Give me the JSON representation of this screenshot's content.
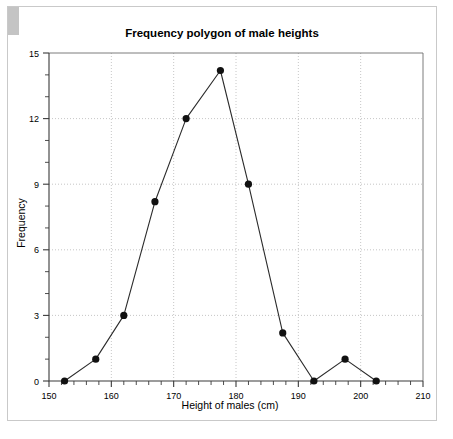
{
  "chart_data": {
    "type": "line",
    "title": "Frequency polygon of male heights",
    "xlabel": "Height of males (cm)",
    "ylabel": "Frequency",
    "xlim": [
      150,
      210
    ],
    "ylim": [
      0,
      15
    ],
    "grid": true,
    "legend": "none",
    "marker": "filled-circle",
    "x_ticks_major": [
      150,
      160,
      170,
      180,
      190,
      200,
      210
    ],
    "x_tick_labels": [
      "150",
      "160",
      "170",
      "180",
      "190",
      "200",
      "210"
    ],
    "x_minor_step": 2,
    "y_ticks_major": [
      0,
      3,
      6,
      9,
      12,
      15
    ],
    "y_tick_labels": [
      "0",
      "3",
      "6",
      "9",
      "12",
      "15"
    ],
    "y_minor_step": 1,
    "series": [
      {
        "name": "Male heights frequency polygon",
        "x": [
          152.5,
          157.5,
          162,
          167,
          172,
          177.5,
          182,
          187.5,
          192.5,
          197.5,
          202.5
        ],
        "values": [
          0,
          1,
          3,
          8.2,
          12,
          14.2,
          9,
          2.2,
          0,
          1,
          0
        ]
      }
    ]
  }
}
